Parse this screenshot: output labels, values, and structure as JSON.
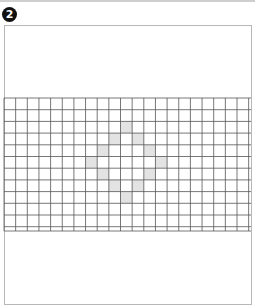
{
  "figure": {
    "badge_label": "2",
    "badge_icon": "circled-number-icon",
    "colors": {
      "badge_bg": "#111111",
      "badge_fg": "#ffffff",
      "frame_border": "#b8b8b8",
      "grid_line": "#555555",
      "filled_cell": "#e3e3e3",
      "background": "#ffffff"
    },
    "grid": {
      "x0": 4,
      "y0": 98,
      "x1": 251,
      "y1": 231,
      "cell_w": 11.65,
      "cell_h": 11.7,
      "columns": 22,
      "rows": 12,
      "filled_cells": [
        {
          "col": 10,
          "row": 2
        },
        {
          "col": 9,
          "row": 3
        },
        {
          "col": 11,
          "row": 3
        },
        {
          "col": 8,
          "row": 4
        },
        {
          "col": 12,
          "row": 4
        },
        {
          "col": 7,
          "row": 5
        },
        {
          "col": 13,
          "row": 5
        },
        {
          "col": 8,
          "row": 6
        },
        {
          "col": 12,
          "row": 6
        },
        {
          "col": 9,
          "row": 7
        },
        {
          "col": 11,
          "row": 7
        },
        {
          "col": 10,
          "row": 8
        }
      ]
    }
  }
}
